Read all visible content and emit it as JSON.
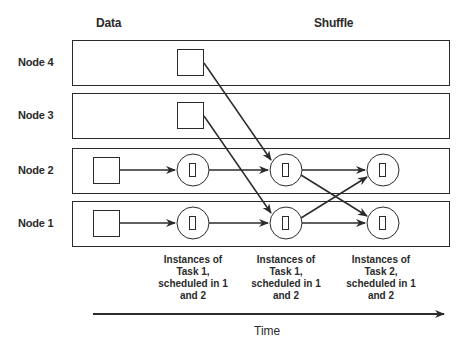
{
  "headers": {
    "data": "Data",
    "shuffle": "Shuffle"
  },
  "nodes": [
    {
      "label": "Node 4"
    },
    {
      "label": "Node 3"
    },
    {
      "label": "Node 2"
    },
    {
      "label": "Node 1"
    }
  ],
  "captions": [
    {
      "line1": "Instances of",
      "line2": "Task 1,",
      "line3": "scheduled in 1",
      "line4": "and 2"
    },
    {
      "line1": "Instances of",
      "line2": "Task 1,",
      "line3": "scheduled in 1",
      "line4": "and 2"
    },
    {
      "line1": "Instances of",
      "line2": "Task 2,",
      "line3": "scheduled in 1",
      "line4": "and 2"
    }
  ],
  "axis": {
    "label": "Time"
  },
  "colors": {
    "stroke": "#2b2b2b",
    "background": "#ffffff"
  }
}
